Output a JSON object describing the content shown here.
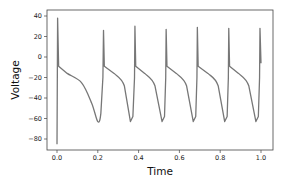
{
  "chart_data": {
    "type": "line",
    "title": "",
    "xlabel": "Time",
    "ylabel": "Voltage",
    "xlim": [
      -0.05,
      1.05
    ],
    "ylim": [
      -92,
      43
    ],
    "xticks": [
      0.0,
      0.2,
      0.4,
      0.6,
      0.8,
      1.0
    ],
    "xtick_labels": [
      "0.0",
      "0.2",
      "0.4",
      "0.6",
      "0.8",
      "1.0"
    ],
    "yticks": [
      40,
      20,
      0,
      -20,
      -40,
      -60,
      -80
    ],
    "ytick_labels": [
      "40",
      "20",
      "0",
      "−20",
      "−40",
      "−60",
      "−80"
    ],
    "grid": false,
    "legend": null,
    "series": [
      {
        "name": "membrane potential",
        "color": "#777777",
        "spike_times": [
          0.0,
          0.228,
          0.382,
          0.535,
          0.688,
          0.842,
          0.995
        ],
        "spike_peaks": [
          38,
          26,
          30,
          27,
          29,
          28,
          28
        ],
        "trough_value": -64,
        "plateau_value": -9,
        "initial_value": -85,
        "final_value": -6,
        "x": [
          0.0,
          0.003,
          0.008,
          0.05,
          0.12,
          0.17,
          0.2,
          0.215,
          0.225,
          0.228,
          0.232,
          0.28,
          0.33,
          0.36,
          0.372,
          0.38,
          0.382,
          0.386,
          0.43,
          0.48,
          0.515,
          0.527,
          0.533,
          0.535,
          0.539,
          0.585,
          0.635,
          0.668,
          0.68,
          0.686,
          0.688,
          0.692,
          0.74,
          0.79,
          0.822,
          0.834,
          0.84,
          0.842,
          0.846,
          0.89,
          0.94,
          0.975,
          0.987,
          0.993,
          0.995,
          1.0
        ],
        "y": [
          -85,
          38,
          -9,
          -16,
          -25,
          -45,
          -63,
          -55,
          -20,
          26,
          -9,
          -16,
          -28,
          -63,
          -58,
          -20,
          30,
          -9,
          -16,
          -28,
          -63,
          -58,
          -20,
          27,
          -9,
          -16,
          -28,
          -63,
          -58,
          -20,
          29,
          -9,
          -16,
          -28,
          -63,
          -58,
          -20,
          28,
          -9,
          -16,
          -28,
          -63,
          -58,
          -20,
          28,
          -6
        ]
      }
    ]
  },
  "axes": {
    "x_title": "Time",
    "y_title": "Voltage"
  }
}
